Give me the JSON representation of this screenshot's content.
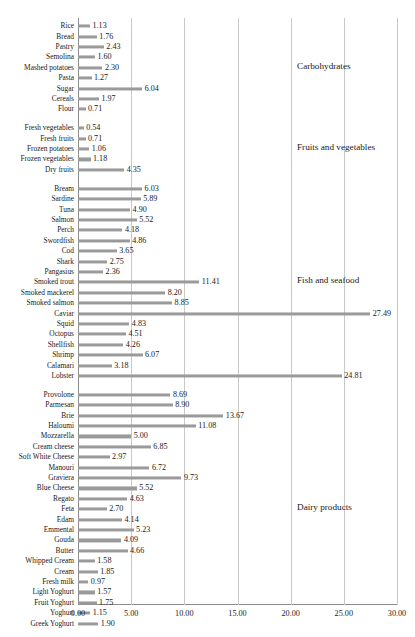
{
  "chart_data": {
    "type": "bar",
    "orientation": "horizontal",
    "title": "",
    "xlabel": "",
    "ylabel": "",
    "xlim": [
      0,
      30
    ],
    "xticks": [
      "0.00",
      "5.00",
      "10.00",
      "15.00",
      "20.00",
      "25.00",
      "30.00"
    ],
    "xtick_values": [
      0,
      5,
      10,
      15,
      20,
      25,
      30
    ],
    "grid": true,
    "legend": "none",
    "bar_color": "#9a9a9a",
    "value_format": "2dp",
    "groups": [
      {
        "name": "Carbohydrates",
        "categories": [
          "Rice",
          "Bread",
          "Pastry",
          "Semolina",
          "Mashed potatoes",
          "Pasta",
          "Sugar",
          "Cereals",
          "Flour"
        ],
        "values": [
          1.13,
          1.76,
          2.43,
          1.6,
          2.3,
          1.27,
          6.04,
          1.97,
          0.71
        ]
      },
      {
        "name": "Fruits and vegetables",
        "categories": [
          "Fresh vegetables",
          "Fresh fruits",
          "Frozen potatoes",
          "Frozen vegetables",
          "Dry fruits"
        ],
        "values": [
          0.54,
          0.71,
          1.06,
          1.18,
          4.35
        ]
      },
      {
        "name": "Fish and seafood",
        "categories": [
          "Bream",
          "Sardine",
          "Tuna",
          "Salmon",
          "Perch",
          "Swordfish",
          "Cod",
          "Shark",
          "Pangasius",
          "Smoked trout",
          "Smoked mackerel",
          "Smoked salmon",
          "Caviar",
          "Squid",
          "Octopus",
          "Shellfish",
          "Shrimp",
          "Calamari",
          "Lobster"
        ],
        "values": [
          6.03,
          5.89,
          4.9,
          5.52,
          4.18,
          4.86,
          3.65,
          2.75,
          2.36,
          11.41,
          8.2,
          8.85,
          27.49,
          4.83,
          4.51,
          4.26,
          6.07,
          3.18,
          24.81
        ]
      },
      {
        "name": "Dairy products",
        "categories": [
          "Provolone",
          "Parmesan",
          "Brie",
          "Haloumi",
          "Mozzarella",
          "Cream cheese",
          "Soft White Cheese",
          "Manouri",
          "Graviera",
          "Blue Cheese",
          "Regato",
          "Feta",
          "Edam",
          "Emmental",
          "Gouda",
          "Butter",
          "Whipped Cream",
          "Cream",
          "Fresh milk",
          "Light Yoghurt",
          "Fruit Yoghurt",
          "Yoghurt",
          "Greek Yoghurt"
        ],
        "values": [
          8.69,
          8.9,
          13.67,
          11.08,
          5.0,
          6.85,
          2.97,
          6.72,
          9.73,
          5.52,
          4.63,
          2.7,
          4.14,
          5.23,
          4.09,
          4.66,
          1.58,
          1.85,
          0.97,
          1.57,
          1.75,
          1.15,
          1.9
        ]
      },
      {
        "name": "Meats and cold cuts",
        "categories": [
          "Lamb",
          "Turkey",
          "Duck",
          "Chicken",
          "Beef",
          "Rabbit",
          "Pork",
          "Prosciutto",
          "Turkey",
          "Mortadella",
          "Salami",
          "Ham",
          "Sausage",
          "Bacon"
        ],
        "values": [
          5.9,
          3.67,
          4.01,
          2.29,
          4.94,
          3.53,
          3.42,
          7.28,
          4.46,
          3.6,
          4.49,
          4.14,
          2.36,
          3.88
        ]
      }
    ]
  }
}
